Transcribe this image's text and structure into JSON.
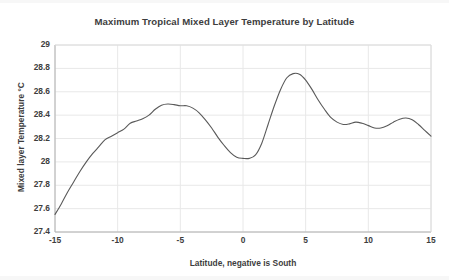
{
  "chart_data": {
    "type": "line",
    "title": "Maximum Tropical Mixed Layer Temperature by Latitude",
    "xlabel": "Latitude, negative is South",
    "ylabel": "Mixed layer Temperature °C",
    "xlim": [
      -15,
      15
    ],
    "ylim": [
      27.4,
      29
    ],
    "xticks": [
      "-15",
      "-10",
      "-5",
      "0",
      "5",
      "10",
      "15"
    ],
    "xtick_values": [
      -15,
      -10,
      -5,
      0,
      5,
      10,
      15
    ],
    "yticks": [
      "27.4",
      "27.6",
      "27.8",
      "28",
      "28.2",
      "28.4",
      "28.6",
      "28.8",
      "29"
    ],
    "ytick_values": [
      27.4,
      27.6,
      27.8,
      28,
      28.2,
      28.4,
      28.6,
      28.8,
      29
    ],
    "grid": true,
    "grid_color": "#e8e8e8",
    "legend": false,
    "line_color": "#595959",
    "line_width": 1.1,
    "series": [
      {
        "name": "Maximum tropical mixed layer temperature",
        "x": [
          -15.0,
          -14.5,
          -14.0,
          -13.5,
          -13.0,
          -12.5,
          -12.0,
          -11.5,
          -11.0,
          -10.5,
          -10.0,
          -9.5,
          -9.0,
          -8.5,
          -8.0,
          -7.5,
          -7.0,
          -6.5,
          -6.0,
          -5.5,
          -5.0,
          -4.5,
          -4.0,
          -3.5,
          -3.0,
          -2.5,
          -2.0,
          -1.5,
          -1.0,
          -0.5,
          0.0,
          0.5,
          1.0,
          1.5,
          2.0,
          2.5,
          3.0,
          3.5,
          4.0,
          4.5,
          5.0,
          5.5,
          6.0,
          6.5,
          7.0,
          7.5,
          8.0,
          8.5,
          9.0,
          9.5,
          10.0,
          10.5,
          11.0,
          11.5,
          12.0,
          12.5,
          13.0,
          13.5,
          14.0,
          14.5,
          15.0
        ],
        "y": [
          27.55,
          27.64,
          27.74,
          27.83,
          27.92,
          28.0,
          28.07,
          28.13,
          28.19,
          28.22,
          28.25,
          28.28,
          28.33,
          28.35,
          28.37,
          28.4,
          28.45,
          28.485,
          28.495,
          28.49,
          28.48,
          28.48,
          28.46,
          28.42,
          28.36,
          28.29,
          28.21,
          28.14,
          28.08,
          28.04,
          28.03,
          28.03,
          28.06,
          28.16,
          28.32,
          28.48,
          28.62,
          28.72,
          28.755,
          28.75,
          28.7,
          28.62,
          28.53,
          28.45,
          28.38,
          28.34,
          28.32,
          28.325,
          28.34,
          28.33,
          28.31,
          28.29,
          28.29,
          28.31,
          28.34,
          28.365,
          28.375,
          28.36,
          28.32,
          28.27,
          28.22
        ]
      }
    ]
  }
}
